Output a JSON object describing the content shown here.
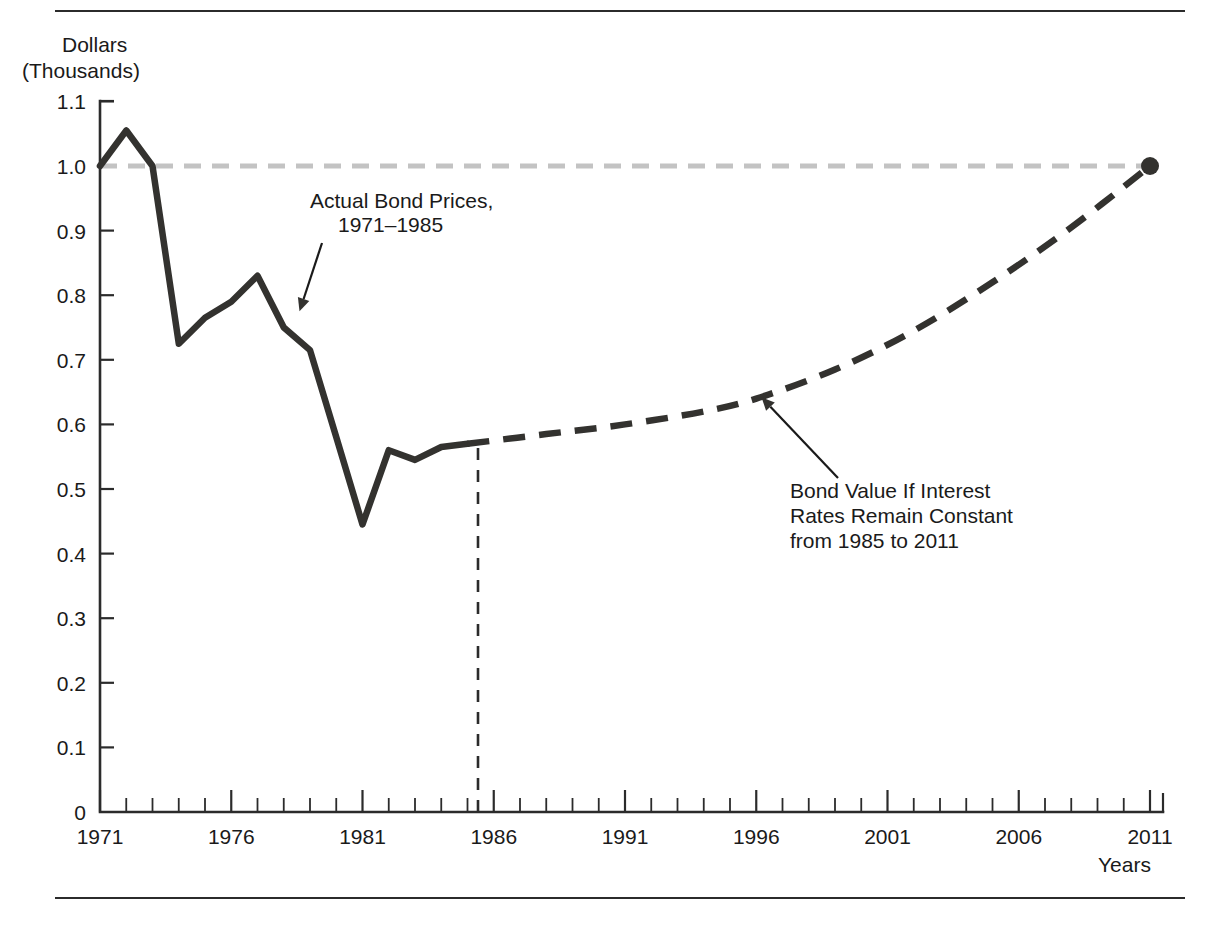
{
  "figure": {
    "y_axis_label_line1": "Dollars",
    "y_axis_label_line2": "(Thousands)",
    "x_axis_label": "Years"
  },
  "chart_data": {
    "type": "line",
    "title": "",
    "xlabel": "Years",
    "ylabel": "Dollars (Thousands)",
    "xlim": [
      1971,
      2011
    ],
    "ylim": [
      0,
      1.1
    ],
    "grid": false,
    "legend": "none",
    "x_tick_labels": [
      "1971",
      "1976",
      "1981",
      "1986",
      "1991",
      "1996",
      "2001",
      "2006",
      "2011"
    ],
    "x_tick_values": [
      1971,
      1976,
      1981,
      1986,
      1991,
      1996,
      2001,
      2006,
      2011
    ],
    "x_minor_tick_step": 1,
    "y_tick_labels": [
      "0",
      "0.1",
      "0.2",
      "0.3",
      "0.4",
      "0.5",
      "0.6",
      "0.7",
      "0.8",
      "0.9",
      "1.0",
      "1.1"
    ],
    "y_tick_values": [
      0,
      0.1,
      0.2,
      0.3,
      0.4,
      0.5,
      0.6,
      0.7,
      0.8,
      0.9,
      1.0,
      1.1
    ],
    "series": [
      {
        "name": "Actual Bond Prices, 1971-1985",
        "style": "solid",
        "color": "#33322f",
        "x": [
          1971,
          1972,
          1973,
          1974,
          1975,
          1976,
          1977,
          1978,
          1979,
          1980,
          1981,
          1982,
          1983,
          1984,
          1985
        ],
        "values": [
          1.0,
          1.055,
          1.0,
          0.725,
          0.765,
          0.79,
          0.83,
          0.75,
          0.715,
          0.58,
          0.445,
          0.56,
          0.545,
          0.565,
          0.57
        ]
      },
      {
        "name": "Bond Value If Interest Rates Remain Constant from 1985 to 2011",
        "style": "dashed",
        "color": "#33322f",
        "x": [
          1985,
          1988,
          1991,
          1994,
          1996,
          1999,
          2002,
          2005,
          2008,
          2011
        ],
        "values": [
          0.57,
          0.585,
          0.6,
          0.62,
          0.64,
          0.685,
          0.745,
          0.82,
          0.905,
          1.0
        ]
      },
      {
        "name": "Par value reference line",
        "style": "dashed-light",
        "color": "#c3c3c3",
        "x": [
          1971,
          2011
        ],
        "values": [
          1.0,
          1.0
        ]
      }
    ],
    "annotations": [
      {
        "id": "actual-bond-prices",
        "lines": [
          "Actual Bond Prices,",
          "1971–1985"
        ],
        "points_to_year": 1978.6,
        "points_to_value": 0.775
      },
      {
        "id": "projected-bond-value",
        "lines": [
          "Bond Value If Interest",
          "Rates Remain Constant",
          "from 1985 to 2011"
        ],
        "points_to_year": 1996.2,
        "points_to_value": 0.642
      }
    ],
    "markers": [
      {
        "id": "endpoint-2011",
        "year": 2011,
        "value": 1.0
      }
    ],
    "divider": {
      "id": "actual-projection-divider",
      "year": 1985.4,
      "from_value": 0,
      "to_value": 0.57
    }
  }
}
